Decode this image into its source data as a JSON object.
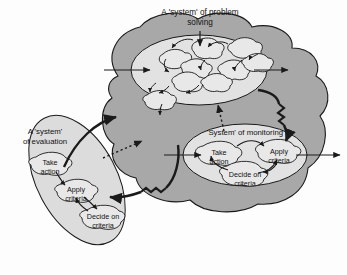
{
  "figure": {
    "title": "A 'system' of problem solving",
    "background_color": "#fdfdfd"
  },
  "colors": {
    "outer_cloud_fill": "#a8a8a8",
    "inner_ellipse_fill": "#e2e2e2",
    "evaluation_fill": "#dcdcdc",
    "blob_fill": "#e8e8e8",
    "stroke": "#1a1a1a",
    "text": "#111111"
  },
  "systems": {
    "problem_solving": {
      "label": "A 'system' of problem solving",
      "blob_count": 9,
      "blob_labels": []
    },
    "monitoring": {
      "label": "'System' of monitoring",
      "steps": [
        {
          "id": "take-action",
          "line1": "Take",
          "line2": "action"
        },
        {
          "id": "apply-criteria",
          "line1": "Apply",
          "line2": "criteria"
        },
        {
          "id": "decide-on-criteria",
          "line1": "Decide on",
          "line2": "criteria"
        }
      ]
    },
    "evaluation": {
      "label_line1": "A 'system'",
      "label_line2": "of evaluation",
      "steps": [
        {
          "id": "take-action",
          "line1": "Take",
          "line2": "action"
        },
        {
          "id": "apply-criteria",
          "line1": "Apply",
          "line2": "criteria"
        },
        {
          "id": "decide-on-criteria",
          "line1": "Decide on",
          "line2": "criteria"
        }
      ]
    }
  },
  "connectors": {
    "title_pointer": "arrow-down-to-problem-solving",
    "input_left": "arrow-into-problem-solving",
    "output_right": "arrow-out-of-problem-solving",
    "monitoring_input_left": "arrow-into-monitoring",
    "monitoring_output_right": "arrow-out-of-monitoring",
    "problem_to_monitoring": "thick-zigzag-arrow-down-right",
    "monitoring_to_evaluation": "thick-zigzag-arrow-left",
    "evaluation_to_problem": "thick-curved-arrow-up-right",
    "monitoring_to_problem_dotted": "dotted-arrow-up",
    "evaluation_to_problem_dotted": "dotted-arrow-up-right"
  }
}
